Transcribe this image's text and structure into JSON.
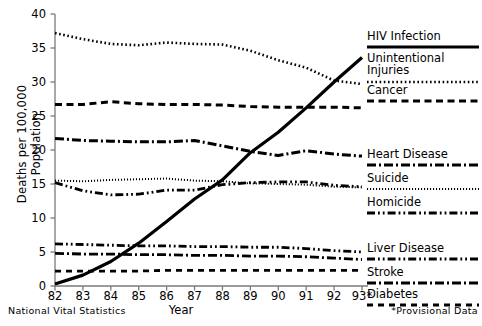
{
  "chart_data": {
    "type": "line",
    "title": "",
    "xlabel": "Year",
    "ylabel": "Deaths per 100,000 Population",
    "x": [
      "82",
      "83",
      "84",
      "85",
      "86",
      "87",
      "88",
      "89",
      "90",
      "91",
      "92",
      "93*"
    ],
    "xtick_labels": [
      "82",
      "83",
      "84",
      "85",
      "86",
      "87",
      "88",
      "89",
      "90",
      "91",
      "92",
      "93*"
    ],
    "ytick_labels": [
      "0",
      "5",
      "10",
      "15",
      "20",
      "25",
      "30",
      "35",
      "40"
    ],
    "ylim": [
      0,
      40
    ],
    "grid": false,
    "legend_position": "right",
    "series": [
      {
        "name": "HIV Infection",
        "style": "solid",
        "values": [
          0.3,
          1.6,
          3.6,
          6.3,
          9.5,
          12.8,
          15.6,
          19.6,
          22.6,
          26.2,
          30.0,
          33.6
        ]
      },
      {
        "name": "Unintentional Injuries",
        "style": "dotted",
        "values": [
          37.2,
          36.3,
          35.6,
          35.4,
          35.8,
          35.6,
          35.5,
          34.6,
          33.2,
          32.1,
          30.2,
          29.7
        ]
      },
      {
        "name": "Cancer",
        "style": "dashed",
        "values": [
          26.7,
          26.7,
          27.1,
          26.8,
          26.7,
          26.7,
          26.6,
          26.4,
          26.3,
          26.3,
          26.3,
          26.2
        ]
      },
      {
        "name": "Heart Disease",
        "style": "dashdot",
        "values": [
          21.7,
          21.4,
          21.3,
          21.2,
          21.2,
          21.4,
          20.6,
          19.8,
          19.2,
          19.9,
          19.4,
          19.1
        ]
      },
      {
        "name": "Suicide",
        "style": "finedotted",
        "values": [
          15.5,
          15.4,
          15.6,
          15.7,
          15.8,
          15.5,
          15.4,
          15.1,
          15.0,
          14.9,
          14.6,
          14.5
        ]
      },
      {
        "name": "Homicide",
        "style": "dashdotdot",
        "values": [
          15.2,
          14.0,
          13.4,
          13.5,
          14.1,
          14.1,
          14.9,
          15.2,
          15.3,
          15.3,
          14.8,
          14.6
        ]
      },
      {
        "name": "Liver Disease",
        "style": "dashdotdot-b",
        "values": [
          6.2,
          6.1,
          6.0,
          5.9,
          5.9,
          5.8,
          5.8,
          5.7,
          5.7,
          5.5,
          5.2,
          5.0
        ]
      },
      {
        "name": "Stroke",
        "style": "dashdot-b",
        "values": [
          4.8,
          4.7,
          4.7,
          4.6,
          4.6,
          4.5,
          4.5,
          4.4,
          4.4,
          4.3,
          4.1,
          3.9
        ]
      },
      {
        "name": "Diabetes",
        "style": "dashed-b",
        "values": [
          2.2,
          2.2,
          2.2,
          2.2,
          2.3,
          2.3,
          2.3,
          2.3,
          2.3,
          2.3,
          2.3,
          2.3
        ]
      }
    ]
  },
  "legend": {
    "items": [
      {
        "label": "HIV Infection",
        "style": "solid"
      },
      {
        "label": "Unintentional Injuries",
        "style": "dotted"
      },
      {
        "label": "Cancer",
        "style": "dashed"
      },
      {
        "label": "Heart Disease",
        "style": "dashdot"
      },
      {
        "label": "Suicide",
        "style": "finedotted"
      },
      {
        "label": "Homicide",
        "style": "dashdotdot"
      },
      {
        "label": "Liver Disease",
        "style": "dashdotdot-b"
      },
      {
        "label": "Stroke",
        "style": "dashdot-b"
      },
      {
        "label": "Diabetes",
        "style": "dashed-b"
      }
    ]
  },
  "footnotes": {
    "source": "National Vital Statistics",
    "provisional": "*Provisional Data"
  },
  "colors": {
    "line": "#000000",
    "axis": "#7a7a7a",
    "background": "#ffffff"
  }
}
